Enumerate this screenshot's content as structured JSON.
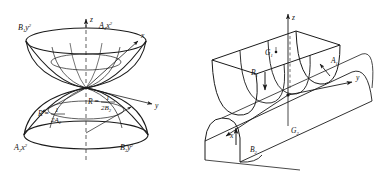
{
  "figure": {
    "background_color": "#ffffff",
    "stroke_color": "#1a1a1a",
    "panels": [
      {
        "id": "left-panel",
        "name": "saddle-paraboloid-pair-diagram",
        "description": "Two opposing bowl surfaces (upper and lower paraboloids) meeting at a saddle point on the z axis",
        "axes": [
          {
            "name": "z-axis",
            "label": "z",
            "style": "dashed-vertical"
          },
          {
            "name": "x-axis",
            "label": "x",
            "style": "solid-arrow-upper-right"
          },
          {
            "name": "y-axis",
            "label": "y",
            "style": "solid-arrow-lower-right"
          }
        ],
        "labels": [
          {
            "name": "curve-label-b1y2",
            "base": "B",
            "sub": "1",
            "var": "y",
            "sup": "2",
            "text": "B₁y²"
          },
          {
            "name": "curve-label-a1x2",
            "base": "A",
            "sub": "1",
            "var": "x",
            "sup": "2",
            "text": "A₁x²"
          },
          {
            "name": "curve-label-a2x2",
            "base": "A",
            "sub": "2",
            "var": "x",
            "sup": "2",
            "text": "A₂x²"
          },
          {
            "name": "curve-label-b2y2",
            "base": "B",
            "sub": "2",
            "var": "y",
            "sup": "2",
            "text": "B₂y²"
          }
        ],
        "radius_annotations": [
          {
            "name": "radius-formula-a2",
            "lhs": "R",
            "equals": "=",
            "numerator": "1",
            "denominator_coef": "2",
            "denominator_sym": "A",
            "denominator_sub": "2",
            "text": "R = 1/(2A₂)"
          },
          {
            "name": "radius-formula-b2",
            "lhs": "R",
            "equals": "=",
            "numerator": "1",
            "denominator_coef": "2",
            "denominator_sym": "B",
            "denominator_sub": "2",
            "text": "R = 1/(2B₂)"
          }
        ]
      },
      {
        "id": "right-panel",
        "name": "parabolic-trough-diagram",
        "description": "Parabolic cylinder trough with upper and lower surfaces and principal curvature direction markers",
        "axes": [
          {
            "name": "z-axis",
            "label": "z",
            "style": "solid-arrow-up"
          },
          {
            "name": "y-axis",
            "label": "y",
            "style": "solid-arrow-right"
          },
          {
            "name": "x-axis",
            "label": "x",
            "style": "solid-arrow-lower-left"
          }
        ],
        "labels": [
          {
            "name": "point-label-g1",
            "base": "G",
            "sub": "1",
            "text": "G₁"
          },
          {
            "name": "point-label-g2",
            "base": "G",
            "sub": "2",
            "text": "G₂"
          },
          {
            "name": "arrow-label-a1",
            "base": "A",
            "sub": "1",
            "text": "A₁"
          },
          {
            "name": "arrow-label-b1",
            "base": "B",
            "sub": "1",
            "text": "B₁"
          },
          {
            "name": "arrow-label-b2",
            "base": "B",
            "sub": "2",
            "text": "B₂"
          }
        ]
      }
    ]
  }
}
